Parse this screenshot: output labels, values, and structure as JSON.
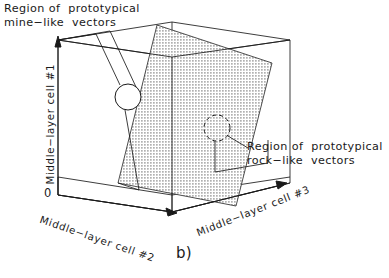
{
  "figure": {
    "caption": "b)",
    "annotations": {
      "mine_region": {
        "line1": "Region of  prototypical",
        "line2": "mine−like  vectors"
      },
      "rock_region": {
        "line1": "Region of  prototypical",
        "line2": "rock−like  vectors"
      }
    },
    "axes": {
      "vertical": "Middle−layer cell #1",
      "left_depth": "Middle−layer cell #2",
      "right_depth": "Middle−layer cell #3",
      "origin": "0"
    },
    "colors": {
      "stroke": "#1a1a1a",
      "plane_fill": "#d9d9d9",
      "background": "#ffffff"
    },
    "callouts": {
      "mine_circle": "solid-circle-mine-region",
      "rock_circle": "dashed-circle-rock-region"
    }
  }
}
